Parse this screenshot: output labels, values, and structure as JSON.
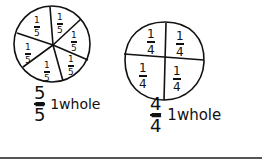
{
  "drawing": {
    "circle_fifths": {
      "section_count": 6,
      "section_labels": [
        "1/5",
        "1/5",
        "1/5",
        "1/5",
        "1/5",
        "1/5"
      ],
      "numerator": "5",
      "denominator": "5",
      "equation_text": "= 1whole"
    },
    "circle_fourths": {
      "section_count": 4,
      "section_labels": [
        "1/4",
        "1/4",
        "1/4",
        "1/4"
      ],
      "numerator": "4",
      "denominator": "4",
      "equation_text": "= 1whole"
    },
    "ink_color": "#111111"
  },
  "sections": {
    "fifths": [
      {
        "n": "1",
        "d": "5"
      },
      {
        "n": "1",
        "d": "5"
      },
      {
        "n": "1",
        "d": "5"
      },
      {
        "n": "1",
        "d": "5"
      },
      {
        "n": "1",
        "d": "5"
      },
      {
        "n": "1",
        "d": "5"
      }
    ],
    "fourths": [
      {
        "n": "1",
        "d": "4"
      },
      {
        "n": "1",
        "d": "4"
      },
      {
        "n": "1",
        "d": "4"
      },
      {
        "n": "1",
        "d": "4"
      }
    ]
  }
}
